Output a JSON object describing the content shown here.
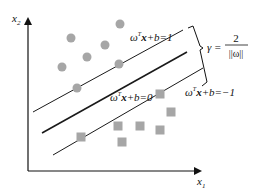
{
  "diagram": {
    "axes": {
      "x_label": "x",
      "x_sub": "1",
      "y_label": "x",
      "y_sub": "2"
    },
    "hyperplanes": {
      "positive": {
        "w": "ω",
        "sup": "T",
        "x": "x",
        "rest": "+b=1"
      },
      "decision": {
        "w": "ω",
        "sup": "T",
        "x": "x",
        "rest": "+b=0"
      },
      "negative": {
        "w": "ω",
        "sup": "T",
        "x": "x",
        "rest": "+b=−1"
      }
    },
    "margin": {
      "gamma": "γ =",
      "numerator": "2",
      "denominator": "||ω||"
    },
    "colors": {
      "points": "#a6a6a6",
      "lines": "#1a1a1a"
    },
    "circles": [
      {
        "x": 71,
        "y": 38
      },
      {
        "x": 120,
        "y": 24
      },
      {
        "x": 105,
        "y": 45
      },
      {
        "x": 87,
        "y": 57
      },
      {
        "x": 62,
        "y": 67
      },
      {
        "x": 119,
        "y": 64
      },
      {
        "x": 77,
        "y": 88
      }
    ],
    "squares": [
      {
        "x": 160,
        "y": 94
      },
      {
        "x": 171,
        "y": 112
      },
      {
        "x": 118,
        "y": 126
      },
      {
        "x": 140,
        "y": 126
      },
      {
        "x": 160,
        "y": 130
      },
      {
        "x": 122,
        "y": 142
      },
      {
        "x": 81,
        "y": 137
      }
    ]
  }
}
